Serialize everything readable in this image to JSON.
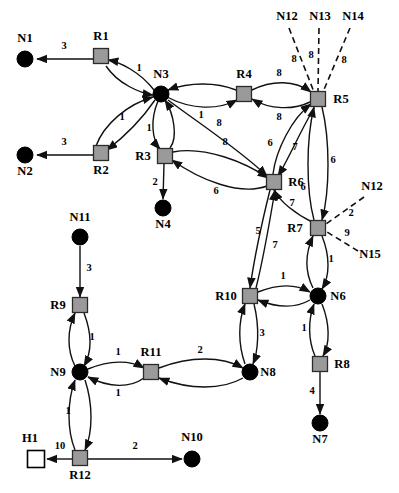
{
  "diagram": {
    "background_color": "#ffffff",
    "stroke_color": "#111111",
    "router_fill": "#9a9a9a",
    "host_fill": "#000000",
    "open_node_fill": "#ffffff",
    "nodes": [
      {
        "id": "N1",
        "label": "N1",
        "type": "host",
        "x": 25,
        "y": 59,
        "r": 8,
        "label_x": 25,
        "label_y": 42
      },
      {
        "id": "R1",
        "label": "R1",
        "type": "router",
        "x": 101,
        "y": 56,
        "s": 15,
        "label_x": 101,
        "label_y": 40
      },
      {
        "id": "N3",
        "label": "N3",
        "type": "host",
        "x": 161,
        "y": 94,
        "r": 8,
        "label_x": 161,
        "label_y": 78
      },
      {
        "id": "R4",
        "label": "R4",
        "type": "router",
        "x": 244,
        "y": 94,
        "s": 15,
        "label_x": 244,
        "label_y": 78
      },
      {
        "id": "R5",
        "label": "R5",
        "type": "router",
        "x": 318,
        "y": 99,
        "s": 15,
        "label_x": 341,
        "label_y": 103
      },
      {
        "id": "N2",
        "label": "N2",
        "type": "host",
        "x": 25,
        "y": 155,
        "r": 8,
        "label_x": 25,
        "label_y": 175
      },
      {
        "id": "R2",
        "label": "R2",
        "type": "router",
        "x": 101,
        "y": 153,
        "s": 15,
        "label_x": 101,
        "label_y": 174
      },
      {
        "id": "R3",
        "label": "R3",
        "type": "router",
        "x": 165,
        "y": 156,
        "s": 15,
        "label_x": 143,
        "label_y": 160
      },
      {
        "id": "N4",
        "label": "N4",
        "type": "host",
        "x": 163,
        "y": 208,
        "r": 8,
        "label_x": 163,
        "label_y": 228
      },
      {
        "id": "R6",
        "label": "R6",
        "type": "router",
        "x": 274,
        "y": 182,
        "s": 15,
        "label_x": 296,
        "label_y": 186
      },
      {
        "id": "R7",
        "label": "R7",
        "type": "router",
        "x": 318,
        "y": 228,
        "s": 15,
        "label_x": 295,
        "label_y": 232
      },
      {
        "id": "N11",
        "label": "N11",
        "type": "host",
        "x": 80,
        "y": 237,
        "r": 8,
        "label_x": 80,
        "label_y": 221
      },
      {
        "id": "R9",
        "label": "R9",
        "type": "router",
        "x": 80,
        "y": 305,
        "s": 15,
        "label_x": 58,
        "label_y": 309
      },
      {
        "id": "R10",
        "label": "R10",
        "type": "router",
        "x": 250,
        "y": 296,
        "s": 15,
        "label_x": 226,
        "label_y": 300
      },
      {
        "id": "N6",
        "label": "N6",
        "type": "host",
        "x": 318,
        "y": 296,
        "r": 8,
        "label_x": 338,
        "label_y": 300
      },
      {
        "id": "N9",
        "label": "N9",
        "type": "host",
        "x": 80,
        "y": 372,
        "r": 8,
        "label_x": 58,
        "label_y": 376
      },
      {
        "id": "R11",
        "label": "R11",
        "type": "router",
        "x": 151,
        "y": 372,
        "s": 15,
        "label_x": 151,
        "label_y": 356
      },
      {
        "id": "N8",
        "label": "N8",
        "type": "host",
        "x": 250,
        "y": 372,
        "r": 8,
        "label_x": 268,
        "label_y": 376
      },
      {
        "id": "R8",
        "label": "R8",
        "type": "router",
        "x": 320,
        "y": 364,
        "s": 15,
        "label_x": 342,
        "label_y": 368
      },
      {
        "id": "N7",
        "label": "N7",
        "type": "host",
        "x": 320,
        "y": 423,
        "r": 8,
        "label_x": 320,
        "label_y": 443
      },
      {
        "id": "H1",
        "label": "H1",
        "type": "open",
        "x": 36,
        "y": 459,
        "s": 17,
        "label_x": 30,
        "label_y": 442
      },
      {
        "id": "R12",
        "label": "R12",
        "type": "router",
        "x": 80,
        "y": 458,
        "s": 15,
        "label_x": 80,
        "label_y": 479
      },
      {
        "id": "N10",
        "label": "N10",
        "type": "host",
        "x": 192,
        "y": 459,
        "r": 8,
        "label_x": 192,
        "label_y": 441
      },
      {
        "id": "N12t",
        "label": "N12",
        "type": "text",
        "x": 287,
        "y": 20,
        "label_x": 287,
        "label_y": 20
      },
      {
        "id": "N13t",
        "label": "N13",
        "type": "text",
        "x": 320,
        "y": 20,
        "label_x": 320,
        "label_y": 20
      },
      {
        "id": "N14t",
        "label": "N14",
        "type": "text",
        "x": 353,
        "y": 20,
        "label_x": 353,
        "label_y": 20
      },
      {
        "id": "N12b",
        "label": "N12",
        "type": "text",
        "x": 372,
        "y": 190,
        "label_x": 372,
        "label_y": 190
      },
      {
        "id": "N15",
        "label": "N15",
        "type": "text",
        "x": 370,
        "y": 258,
        "label_x": 370,
        "label_y": 258
      }
    ],
    "edges": [
      {
        "from": "R1",
        "to": "N1",
        "weight": "3",
        "style": "solid",
        "arrow": "end",
        "d": "M 93 59 L 37 59",
        "wx": 64,
        "wy": 49
      },
      {
        "from": "N3",
        "to": "R1",
        "weight": "1",
        "style": "solid",
        "arrow": "end",
        "d": "M 154 90 C 140 72 120 62 108 60",
        "wx": 139,
        "wy": 71
      },
      {
        "from": "R1",
        "to": "N3",
        "weight": "",
        "style": "solid",
        "arrow": "end",
        "d": "M 106 66 C 118 84 140 93 153 95",
        "wx": 0,
        "wy": 0
      },
      {
        "from": "N3",
        "to": "R2",
        "weight": "1",
        "style": "solid",
        "arrow": "end",
        "d": "M 155 100 C 140 122 120 140 107 150",
        "wx": 122,
        "wy": 120
      },
      {
        "from": "R2",
        "to": "N3",
        "weight": "",
        "style": "solid",
        "arrow": "end",
        "d": "M 96 146 C 104 124 128 104 153 97",
        "wx": 0,
        "wy": 0
      },
      {
        "from": "R2",
        "to": "N2",
        "weight": "3",
        "style": "solid",
        "arrow": "end",
        "d": "M 93 155 L 37 155",
        "wx": 64,
        "wy": 145
      },
      {
        "from": "N3",
        "to": "R3",
        "weight": "1",
        "style": "solid",
        "arrow": "end",
        "d": "M 158 101 C 150 120 152 140 160 149",
        "wx": 149,
        "wy": 131
      },
      {
        "from": "R3",
        "to": "N3",
        "weight": "",
        "style": "solid",
        "arrow": "end",
        "d": "M 170 148 C 178 138 174 114 165 100",
        "wx": 0,
        "wy": 0
      },
      {
        "from": "R3",
        "to": "N4",
        "weight": "2",
        "style": "solid",
        "arrow": "end",
        "d": "M 164 164 L 163 199",
        "wx": 155,
        "wy": 185
      },
      {
        "from": "N3",
        "to": "R4",
        "weight": "1",
        "style": "solid",
        "arrow": "end",
        "d": "M 167 97 C 192 110 218 110 237 100",
        "wx": 201,
        "wy": 118
      },
      {
        "from": "R4",
        "to": "N3",
        "weight": "",
        "style": "solid",
        "arrow": "end",
        "d": "M 236 90 C 216 82 190 82 168 90",
        "wx": 0,
        "wy": 0
      },
      {
        "from": "R4",
        "to": "R5",
        "weight": "8",
        "style": "solid",
        "arrow": "end",
        "d": "M 252 90 C 272 80 295 80 311 92",
        "wx": 279,
        "wy": 76
      },
      {
        "from": "R5",
        "to": "R4",
        "weight": "8",
        "style": "solid",
        "arrow": "end",
        "d": "M 310 102 C 294 110 270 110 252 99",
        "wx": 279,
        "wy": 120
      },
      {
        "from": "N3",
        "to": "R6",
        "weight": "8",
        "style": "solid",
        "arrow": "end",
        "d": "M 168 100 C 200 124 240 150 267 176",
        "wx": 219,
        "wy": 126
      },
      {
        "from": "R6",
        "to": "R3",
        "weight": "6",
        "style": "solid",
        "arrow": "end",
        "d": "M 267 186 C 240 196 200 180 172 160",
        "wx": 216,
        "wy": 194
      },
      {
        "from": "R3",
        "to": "R6",
        "weight": "8",
        "style": "solid",
        "arrow": "end",
        "d": "M 173 152 C 205 146 245 162 268 178",
        "wx": 225,
        "wy": 145
      },
      {
        "from": "R6",
        "to": "R5",
        "weight": "6",
        "style": "solid",
        "arrow": "end",
        "d": "M 273 174 C 276 150 292 118 311 104",
        "wx": 270,
        "wy": 146
      },
      {
        "from": "R5",
        "to": "R6",
        "weight": "7",
        "style": "solid",
        "arrow": "end",
        "d": "M 314 108 C 300 132 288 160 278 176",
        "wx": 295,
        "wy": 150
      },
      {
        "from": "R5",
        "to": "R7",
        "weight": "6",
        "style": "solid",
        "arrow": "end",
        "d": "M 322 107 C 330 140 330 190 322 220",
        "wx": 333,
        "wy": 163
      },
      {
        "from": "R7",
        "to": "R5",
        "weight": "6",
        "style": "solid",
        "arrow": "end",
        "d": "M 314 220 C 306 190 306 140 314 107",
        "wx": 303,
        "wy": 190
      },
      {
        "from": "R7",
        "to": "R6",
        "weight": "7",
        "style": "solid",
        "arrow": "end",
        "d": "M 312 222 C 296 214 280 202 274 190",
        "wx": 292,
        "wy": 206
      },
      {
        "from": "R6",
        "to": "R10",
        "weight": "5",
        "style": "solid",
        "arrow": "end",
        "d": "M 270 190 C 262 222 254 260 250 288",
        "wx": 258,
        "wy": 234
      },
      {
        "from": "R10",
        "to": "R6",
        "weight": "7",
        "style": "solid",
        "arrow": "end",
        "d": "M 256 288 C 264 256 270 220 275 190",
        "wx": 275,
        "wy": 248
      },
      {
        "from": "R7",
        "to": "N6",
        "weight": "1",
        "style": "solid",
        "arrow": "end",
        "d": "M 322 236 C 330 256 330 276 322 289",
        "wx": 331,
        "wy": 262
      },
      {
        "from": "N6",
        "to": "R7",
        "weight": "",
        "style": "solid",
        "arrow": "end",
        "d": "M 313 288 C 305 272 305 254 313 236",
        "wx": 0,
        "wy": 0
      },
      {
        "from": "R10",
        "to": "N6",
        "weight": "1",
        "style": "solid",
        "arrow": "end",
        "d": "M 258 292 C 278 284 296 284 310 292",
        "wx": 283,
        "wy": 279
      },
      {
        "from": "N6",
        "to": "R10",
        "weight": "",
        "style": "solid",
        "arrow": "end",
        "d": "M 310 300 C 296 308 278 308 258 300",
        "wx": 0,
        "wy": 0
      },
      {
        "from": "N6",
        "to": "R8",
        "weight": "1",
        "style": "solid",
        "arrow": "end",
        "d": "M 322 304 C 330 324 330 344 323 356",
        "wx": 304,
        "wy": 331
      },
      {
        "from": "R8",
        "to": "N6",
        "weight": "",
        "style": "solid",
        "arrow": "end",
        "d": "M 315 356 C 308 340 308 320 314 304",
        "wx": 0,
        "wy": 0
      },
      {
        "from": "R8",
        "to": "N7",
        "weight": "4",
        "style": "solid",
        "arrow": "end",
        "d": "M 320 372 L 320 414",
        "wx": 312,
        "wy": 394
      },
      {
        "from": "R10",
        "to": "N8",
        "weight": "3",
        "style": "solid",
        "arrow": "end",
        "d": "M 254 304 C 260 328 258 352 253 364",
        "wx": 262,
        "wy": 336
      },
      {
        "from": "N8",
        "to": "R10",
        "weight": "",
        "style": "solid",
        "arrow": "end",
        "d": "M 245 364 C 238 344 238 322 245 304",
        "wx": 0,
        "wy": 0
      },
      {
        "from": "N11",
        "to": "R9",
        "weight": "3",
        "style": "solid",
        "arrow": "end",
        "d": "M 80 246 L 80 297",
        "wx": 89,
        "wy": 271
      },
      {
        "from": "R9",
        "to": "N9",
        "weight": "1",
        "style": "solid",
        "arrow": "end",
        "d": "M 84 313 C 92 334 92 352 84 366",
        "wx": 92,
        "wy": 340
      },
      {
        "from": "N9",
        "to": "R9",
        "weight": "",
        "style": "solid",
        "arrow": "end",
        "d": "M 75 366 C 67 350 67 330 75 313",
        "wx": 0,
        "wy": 0
      },
      {
        "from": "N9",
        "to": "R11",
        "weight": "1",
        "style": "solid",
        "arrow": "end",
        "d": "M 88 369 C 110 360 130 360 144 368",
        "wx": 118,
        "wy": 355
      },
      {
        "from": "R11",
        "to": "N9",
        "weight": "1",
        "style": "solid",
        "arrow": "end",
        "d": "M 144 378 C 130 388 110 388 88 377",
        "wx": 118,
        "wy": 396
      },
      {
        "from": "R11",
        "to": "N8",
        "weight": "2",
        "style": "solid",
        "arrow": "end",
        "d": "M 159 368 C 190 356 222 356 243 368",
        "wx": 200,
        "wy": 353
      },
      {
        "from": "N8",
        "to": "R11",
        "weight": "",
        "style": "solid",
        "arrow": "end",
        "d": "M 243 378 C 222 390 190 390 159 378",
        "wx": 0,
        "wy": 0
      },
      {
        "from": "N9",
        "to": "R12",
        "weight": "1",
        "style": "solid",
        "arrow": "end",
        "d": "M 85 380 C 93 404 93 432 85 450",
        "wx": 68,
        "wy": 414
      },
      {
        "from": "R12",
        "to": "N9",
        "weight": "",
        "style": "solid",
        "arrow": "end",
        "d": "M 75 450 C 67 430 67 402 75 380",
        "wx": 0,
        "wy": 0
      },
      {
        "from": "R12",
        "to": "H1",
        "weight": "10",
        "style": "solid",
        "arrow": "end",
        "d": "M 72 459 L 47 459",
        "wx": 60,
        "wy": 449
      },
      {
        "from": "R12",
        "to": "N10",
        "weight": "2",
        "style": "solid",
        "arrow": "end",
        "d": "M 88 459 L 182 459",
        "wx": 135,
        "wy": 449
      },
      {
        "from": "N12t",
        "to": "R5",
        "weight": "8",
        "style": "dashed",
        "arrow": "none",
        "d": "M 289 28 L 314 92",
        "wx": 294,
        "wy": 62
      },
      {
        "from": "N13t",
        "to": "R5",
        "weight": "8",
        "style": "dashed",
        "arrow": "none",
        "d": "M 319 28 L 318 91",
        "wx": 311,
        "wy": 58
      },
      {
        "from": "N14t",
        "to": "R5",
        "weight": "8",
        "style": "dashed",
        "arrow": "none",
        "d": "M 350 28 L 323 92",
        "wx": 344,
        "wy": 63
      },
      {
        "from": "N12b",
        "to": "R7",
        "weight": "2",
        "style": "dashed",
        "arrow": "none",
        "d": "M 364 197 L 326 224",
        "wx": 351,
        "wy": 216
      },
      {
        "from": "N15",
        "to": "R7",
        "weight": "9",
        "style": "dashed",
        "arrow": "none",
        "d": "M 358 251 L 327 232",
        "wx": 347,
        "wy": 236
      }
    ]
  },
  "caption": {
    "text": ""
  }
}
